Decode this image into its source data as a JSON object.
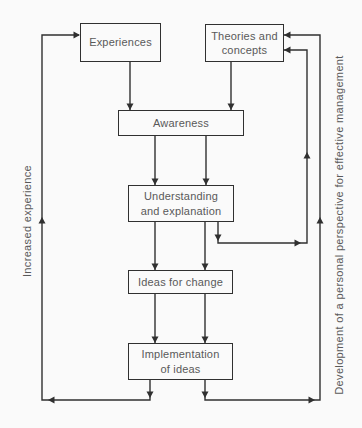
{
  "diagram": {
    "type": "flowchart",
    "boxes": {
      "experiences": "Experiences",
      "theories": "Theories and\nconcepts",
      "awareness": "Awareness",
      "understanding": "Understanding\nand explanation",
      "ideas": "Ideas for change",
      "implementation": "Implementation\nof ideas"
    },
    "side_labels": {
      "left": "Increased experience",
      "right": "Development of a personal perspective for effective management"
    },
    "flows": [
      "Experiences -> Awareness",
      "Theories and concepts -> Awareness",
      "Awareness -> Understanding and explanation",
      "Understanding and explanation -> Ideas for change",
      "Understanding and explanation -> Theories and concepts (feedback loop)",
      "Ideas for change -> Implementation of ideas",
      "Implementation of ideas -> Experiences (left loop: increased experience)",
      "Implementation of ideas -> Theories and concepts (right loop: development of personal perspective)"
    ],
    "colors": {
      "line": "#303030",
      "text": "#595959",
      "background": "#fafafa"
    }
  }
}
